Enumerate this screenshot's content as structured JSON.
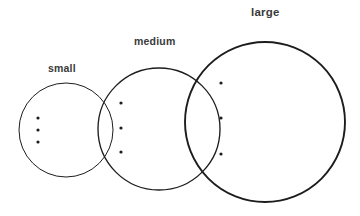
{
  "diagram": {
    "background_color": "#ffffff",
    "stroke_color": "#1d1d1d",
    "label_color": "#3a3a3a",
    "dot_color": "#1d1d1d",
    "labels": {
      "small": "small",
      "medium": "medium",
      "large": "large"
    },
    "groups": [
      {
        "name": "small",
        "label": "small",
        "center_x": 66,
        "center_y": 130,
        "radius": 47,
        "stroke_width": 1,
        "label_x": 48,
        "label_y": 63,
        "dots": [
          {
            "x": 38,
            "y": 118
          },
          {
            "x": 38,
            "y": 130
          },
          {
            "x": 38,
            "y": 142
          }
        ]
      },
      {
        "name": "medium",
        "label": "medium",
        "center_x": 159,
        "center_y": 129,
        "radius": 61,
        "stroke_width": 1.35,
        "label_x": 134,
        "label_y": 36,
        "dots": [
          {
            "x": 121,
            "y": 103
          },
          {
            "x": 121,
            "y": 128
          },
          {
            "x": 121,
            "y": 152
          }
        ]
      },
      {
        "name": "large",
        "label": "large",
        "center_x": 265,
        "center_y": 122,
        "radius": 80,
        "stroke_width": 1.9,
        "label_x": 251,
        "label_y": 7,
        "dots": [
          {
            "x": 221,
            "y": 83
          },
          {
            "x": 221,
            "y": 118
          },
          {
            "x": 221,
            "y": 154
          }
        ]
      }
    ],
    "dot_radius": 1.6
  },
  "chart_data": {
    "type": "scatter",
    "title": "",
    "xlabel": "",
    "ylabel": "",
    "legend": [
      "small",
      "medium",
      "large"
    ],
    "categories": [
      "small",
      "medium",
      "large"
    ],
    "values": [
      47,
      61,
      80
    ],
    "series": [
      {
        "name": "small",
        "radius": 47,
        "center": [
          66,
          130
        ],
        "points": [
          [
            38,
            118
          ],
          [
            38,
            130
          ],
          [
            38,
            142
          ]
        ]
      },
      {
        "name": "medium",
        "radius": 61,
        "center": [
          159,
          129
        ],
        "points": [
          [
            121,
            103
          ],
          [
            121,
            128
          ],
          [
            121,
            152
          ]
        ]
      },
      {
        "name": "large",
        "radius": 80,
        "center": [
          265,
          122
        ],
        "points": [
          [
            221,
            83
          ],
          [
            221,
            118
          ],
          [
            221,
            154
          ]
        ]
      }
    ],
    "grid": false,
    "legend_position": "above-each-shape"
  }
}
